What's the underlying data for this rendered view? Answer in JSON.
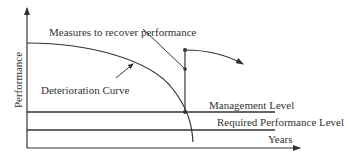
{
  "diagram": {
    "title": "",
    "axes": {
      "y_label": "Performance",
      "x_label": "Years"
    },
    "labels": {
      "measures": "Measures to recover performance",
      "deterioration": "Deterioration Curve",
      "management_level": "Management Level",
      "required_level": "Required Performance Level"
    },
    "colors": {
      "line": "#333333",
      "background": "#ffffff"
    }
  }
}
